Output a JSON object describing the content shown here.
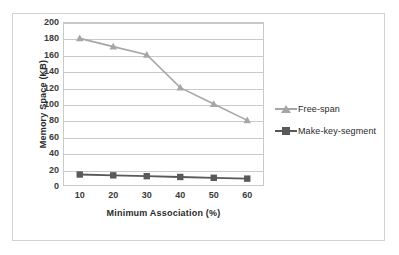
{
  "chart_data": {
    "type": "line",
    "title": "",
    "xlabel": "Minimum  Association (%)",
    "ylabel": "Memory Space (KB)",
    "categories": [
      "10",
      "20",
      "30",
      "40",
      "50",
      "60"
    ],
    "x": [
      10,
      20,
      30,
      40,
      50,
      60
    ],
    "xlim": [
      10,
      60
    ],
    "ylim": [
      0,
      200
    ],
    "ytick_step": 20,
    "yticks": [
      "200",
      "180",
      "160",
      "140",
      "120",
      "100",
      "80",
      "60",
      "40",
      "20",
      "0"
    ],
    "ytick_values": [
      200,
      180,
      160,
      140,
      120,
      100,
      80,
      60,
      40,
      20,
      0
    ],
    "grid": "horizontal",
    "legend_position": "right",
    "series": [
      {
        "name": "Free-span",
        "values": [
          180,
          170,
          160,
          120,
          100,
          80
        ],
        "color": "#a6a6a6",
        "marker": "triangle"
      },
      {
        "name": "Make-key-segment",
        "values": [
          14,
          13,
          12,
          11,
          10,
          9
        ],
        "color": "#595959",
        "marker": "square"
      }
    ]
  },
  "legend": {
    "items": [
      {
        "label": "Free-span"
      },
      {
        "label": "Make-key-segment"
      }
    ]
  },
  "colors": {
    "free_span": "#a6a6a6",
    "make_key_segment": "#595959",
    "gridline": "#c9c9c9",
    "frame": "#d2d2d2",
    "text": "#2b2b2b",
    "background": "#ffffff"
  }
}
